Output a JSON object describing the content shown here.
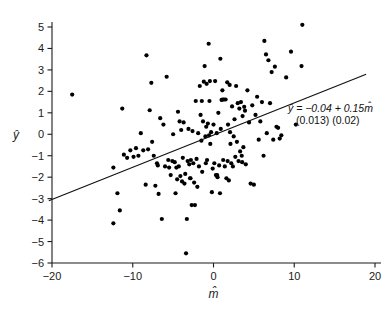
{
  "chart_data": {
    "type": "scatter",
    "title": "",
    "xlabel": "m̂",
    "ylabel": "ŷ",
    "xlim": [
      -20,
      20
    ],
    "ylim": [
      -6,
      5
    ],
    "xticks": [
      -20,
      -10,
      0,
      10,
      20
    ],
    "xtick_labels": [
      "−20",
      "−10",
      "0",
      "10",
      "20"
    ],
    "yticks": [
      -6,
      -5,
      -4,
      -3,
      -2,
      -1,
      0,
      1,
      2,
      3,
      4,
      5
    ],
    "ytick_labels": [
      "−6",
      "−5",
      "−4",
      "−3",
      "−2",
      "−1",
      "0",
      "1",
      "2",
      "3",
      "4",
      "5"
    ],
    "grid": false,
    "legend": null,
    "marker_color": "#000000",
    "marker_size": 2.1,
    "fit_line": {
      "intercept": -0.04,
      "slope": 0.15,
      "x_start": -20.4,
      "x_end": 18.9,
      "color": "#111111"
    },
    "annotations": [
      {
        "id": "regression-equation",
        "text": "ŷ = −0.04 + 0.15m̂",
        "x_px": 288,
        "y_px": 112
      },
      {
        "id": "standard-errors",
        "text": "(0.013) (0.02)",
        "x_px": 296,
        "y_px": 124
      }
    ],
    "points": [
      [
        -17.5,
        1.85
      ],
      [
        -12.4,
        -1.55
      ],
      [
        -12.4,
        -4.15
      ],
      [
        -11.9,
        -2.75
      ],
      [
        -11.6,
        -3.55
      ],
      [
        -11.3,
        1.2
      ],
      [
        -11.1,
        -0.95
      ],
      [
        -10.7,
        -1.1
      ],
      [
        -10.3,
        -0.75
      ],
      [
        -9.9,
        -1.05
      ],
      [
        -9.6,
        -0.65
      ],
      [
        -9.3,
        -1.0
      ],
      [
        -9.0,
        0.05
      ],
      [
        -8.7,
        -0.75
      ],
      [
        -8.4,
        -2.35
      ],
      [
        -8.3,
        3.68
      ],
      [
        -8.1,
        -0.7
      ],
      [
        -7.9,
        1.12
      ],
      [
        -7.7,
        2.4
      ],
      [
        -7.6,
        -0.35
      ],
      [
        -7.4,
        -1.0
      ],
      [
        -7.2,
        -2.4
      ],
      [
        -7.0,
        -1.35
      ],
      [
        -6.8,
        -2.78
      ],
      [
        -6.6,
        0.75
      ],
      [
        -6.4,
        -3.95
      ],
      [
        -6.2,
        0.45
      ],
      [
        -6.0,
        -1.5
      ],
      [
        -5.8,
        2.68
      ],
      [
        -5.6,
        -1.2
      ],
      [
        -5.5,
        -1.55
      ],
      [
        -5.3,
        -1.9
      ],
      [
        -5.1,
        -1.25
      ],
      [
        -5.0,
        0.0
      ],
      [
        -4.8,
        -1.3
      ],
      [
        -4.7,
        -2.75
      ],
      [
        -4.6,
        -1.55
      ],
      [
        -4.5,
        -2.1
      ],
      [
        -4.4,
        1.05
      ],
      [
        -4.3,
        -1.5
      ],
      [
        -4.2,
        0.6
      ],
      [
        -4.1,
        -1.95
      ],
      [
        -4.0,
        0.2
      ],
      [
        -3.9,
        -2.2
      ],
      [
        -3.8,
        -1.1
      ],
      [
        -3.7,
        0.55
      ],
      [
        -3.6,
        -2.3
      ],
      [
        -3.5,
        -1.85
      ],
      [
        -3.4,
        -5.55
      ],
      [
        -3.3,
        -3.95
      ],
      [
        -3.2,
        -1.25
      ],
      [
        -3.1,
        0.25
      ],
      [
        -3.0,
        -1.4
      ],
      [
        -2.9,
        -2.05
      ],
      [
        -2.8,
        -1.2
      ],
      [
        -2.7,
        -3.3
      ],
      [
        -2.6,
        0.15
      ],
      [
        -2.5,
        -1.35
      ],
      [
        -2.4,
        -2.25
      ],
      [
        -2.3,
        -3.3
      ],
      [
        -2.2,
        1.55
      ],
      [
        -2.1,
        -1.15
      ],
      [
        -2.0,
        -2.45
      ],
      [
        -1.9,
        0.05
      ],
      [
        -1.8,
        -1.5
      ],
      [
        -1.7,
        2.25
      ],
      [
        -1.6,
        0.9
      ],
      [
        -1.5,
        -0.3
      ],
      [
        -1.45,
        1.55
      ],
      [
        -1.4,
        -1.75
      ],
      [
        -1.3,
        0.6
      ],
      [
        -1.2,
        2.45
      ],
      [
        -1.1,
        3.18
      ],
      [
        -1.0,
        -0.1
      ],
      [
        -0.95,
        -1.35
      ],
      [
        -0.9,
        0.35
      ],
      [
        -0.85,
        2.35
      ],
      [
        -0.8,
        -1.2
      ],
      [
        -0.7,
        0.5
      ],
      [
        -0.6,
        4.22
      ],
      [
        -0.55,
        -0.05
      ],
      [
        -0.5,
        1.55
      ],
      [
        -0.45,
        2.48
      ],
      [
        -0.4,
        -0.45
      ],
      [
        -0.3,
        0.1
      ],
      [
        -0.2,
        -2.7
      ],
      [
        -0.1,
        -1.6
      ],
      [
        0.0,
        0.45
      ],
      [
        0.1,
        -1.35
      ],
      [
        0.2,
        2.48
      ],
      [
        0.3,
        -1.9
      ],
      [
        0.4,
        0.05
      ],
      [
        0.5,
        -2.0
      ],
      [
        0.6,
        1.0
      ],
      [
        0.7,
        -1.45
      ],
      [
        0.8,
        -2.75
      ],
      [
        0.85,
        3.52
      ],
      [
        0.9,
        0.25
      ],
      [
        1.0,
        1.6
      ],
      [
        1.1,
        2.05
      ],
      [
        1.2,
        -1.2
      ],
      [
        1.3,
        1.62
      ],
      [
        1.4,
        -1.5
      ],
      [
        1.5,
        1.62
      ],
      [
        1.6,
        -2.05
      ],
      [
        1.7,
        2.42
      ],
      [
        1.75,
        -1.25
      ],
      [
        1.8,
        0.45
      ],
      [
        1.9,
        -2.15
      ],
      [
        2.0,
        2.3
      ],
      [
        2.1,
        -0.45
      ],
      [
        2.2,
        -1.35
      ],
      [
        2.3,
        1.3
      ],
      [
        2.4,
        -1.5
      ],
      [
        2.5,
        -0.1
      ],
      [
        2.6,
        0.7
      ],
      [
        2.7,
        -1.05
      ],
      [
        2.8,
        2.25
      ],
      [
        2.9,
        -0.35
      ],
      [
        3.0,
        1.45
      ],
      [
        3.1,
        -1.25
      ],
      [
        3.2,
        1.2
      ],
      [
        3.3,
        -0.8
      ],
      [
        3.4,
        1.5
      ],
      [
        3.5,
        -1.0
      ],
      [
        3.55,
        -1.3
      ],
      [
        3.6,
        0.85
      ],
      [
        3.7,
        -0.6
      ],
      [
        3.8,
        1.28
      ],
      [
        3.9,
        1.1
      ],
      [
        4.0,
        -1.4
      ],
      [
        4.2,
        2.05
      ],
      [
        4.4,
        0.55
      ],
      [
        4.6,
        -2.3
      ],
      [
        4.8,
        1.35
      ],
      [
        5.0,
        -2.35
      ],
      [
        5.2,
        0.9
      ],
      [
        5.4,
        1.75
      ],
      [
        5.6,
        -0.25
      ],
      [
        5.8,
        0.6
      ],
      [
        6.0,
        1.5
      ],
      [
        6.2,
        -1.0
      ],
      [
        6.3,
        4.35
      ],
      [
        6.5,
        3.72
      ],
      [
        6.6,
        0.05
      ],
      [
        6.8,
        3.45
      ],
      [
        7.0,
        1.45
      ],
      [
        7.2,
        2.9
      ],
      [
        7.4,
        -0.25
      ],
      [
        7.6,
        3.15
      ],
      [
        7.8,
        0.35
      ],
      [
        8.0,
        0.3
      ],
      [
        8.2,
        -0.2
      ],
      [
        8.4,
        -0.05
      ],
      [
        9.0,
        2.65
      ],
      [
        9.6,
        3.85
      ],
      [
        10.2,
        0.45
      ],
      [
        10.9,
        3.18
      ],
      [
        11.0,
        5.1
      ],
      [
        -6.9,
        -1.45
      ],
      [
        -2.85,
        -2.05
      ],
      [
        1.15,
        1.62
      ],
      [
        0.45,
        -1.9
      ],
      [
        2.05,
        0.1
      ]
    ]
  },
  "axis": {
    "x_axis_name": "x-axis",
    "y_axis_name": "y-axis"
  }
}
